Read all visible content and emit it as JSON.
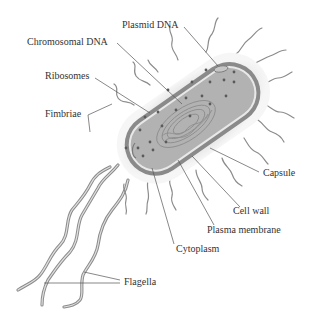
{
  "labels": {
    "plasmid_dna": "Plasmid DNA",
    "chromosomal_dna": "Chromosomal DNA",
    "ribosomes": "Ribosomes",
    "fimbriae": "Fimbriae",
    "capsule": "Capsule",
    "cell_wall": "Cell wall",
    "plasma_membrane": "Plasma membrane",
    "cytoplasm": "Cytoplasm",
    "flagella": "Flagella"
  },
  "colors": {
    "capsule": "#ececec",
    "cell_wall": "#8a8a8a",
    "membrane": "#e4e4e4",
    "cytoplasm": "#b4b4b4",
    "nucleoid": "#9a9a9a",
    "ribosome": "#5a5a5a",
    "appendage": "#8c8c8c",
    "leader": "#555555",
    "text": "#333333"
  }
}
